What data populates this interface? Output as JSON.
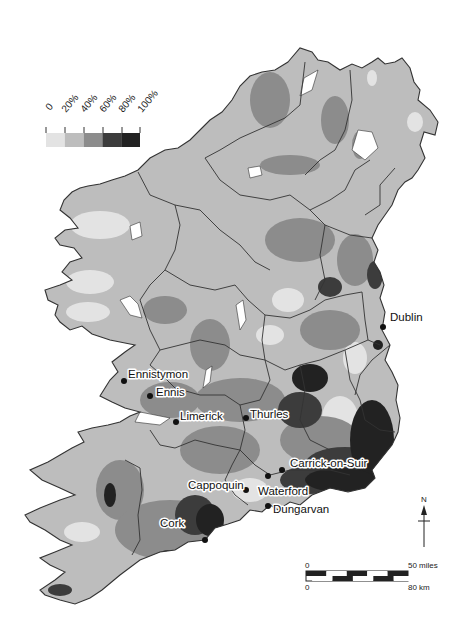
{
  "map": {
    "type": "choropleth-grayscale",
    "region": "Ireland",
    "legend": {
      "tick_labels": [
        "0",
        "20%",
        "40%",
        "60%",
        "80%",
        "100%"
      ],
      "classes": [
        {
          "range": "0-20%",
          "color": "#e3e3e3"
        },
        {
          "range": "20-40%",
          "color": "#bdbdbd"
        },
        {
          "range": "40-60%",
          "color": "#8c8c8c"
        },
        {
          "range": "60-80%",
          "color": "#3c3c3c"
        },
        {
          "range": "80-100%",
          "color": "#222222"
        }
      ]
    },
    "cities": [
      {
        "name": "Dublin"
      },
      {
        "name": "Ennistymon"
      },
      {
        "name": "Ennis"
      },
      {
        "name": "Limerick"
      },
      {
        "name": "Thurles"
      },
      {
        "name": "Carrick-on-Suir"
      },
      {
        "name": "Cappoquin"
      },
      {
        "name": "Waterford"
      },
      {
        "name": "Dungarvan"
      },
      {
        "name": "Cork"
      }
    ],
    "north_arrow": {
      "label": "N"
    },
    "scale_bar": {
      "miles_start": "0",
      "miles_end": "50 miles",
      "km_start": "0",
      "km_end": "80 km"
    },
    "colors": {
      "land_base": "#bdbdbd",
      "water": "#ffffff",
      "border": "#333333"
    }
  }
}
